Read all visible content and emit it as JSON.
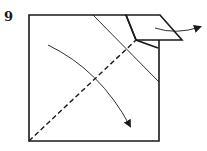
{
  "diagram": {
    "step_number": "9",
    "colors": {
      "ink": "#1a1a1a",
      "paper": "#ffffff"
    }
  }
}
